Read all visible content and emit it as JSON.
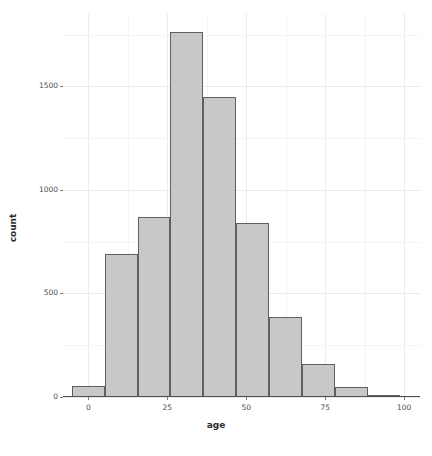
{
  "chart_data": {
    "type": "bar",
    "title": "",
    "subtitle": "",
    "xlabel": "age",
    "ylabel": "count",
    "xlim": [
      -8,
      105
    ],
    "ylim": [
      0,
      1850
    ],
    "grid": true,
    "legend": null,
    "bin_width": 10.4,
    "categories": [
      "-5.2",
      "5.2",
      "15.6",
      "26.0",
      "36.4",
      "46.8",
      "57.2",
      "67.6",
      "78.0",
      "88.4"
    ],
    "bins": [
      {
        "label": "-5.2 to 5.2",
        "x_start": -5.2,
        "x_end": 5.2,
        "value": 55
      },
      {
        "label": "5.2 to 15.6",
        "x_start": 5.2,
        "x_end": 15.6,
        "value": 690
      },
      {
        "label": "15.6 to 26.0",
        "x_start": 15.6,
        "x_end": 26.0,
        "value": 870
      },
      {
        "label": "26.0 to 36.4",
        "x_start": 26.0,
        "x_end": 36.4,
        "value": 1765
      },
      {
        "label": "36.4 to 46.8",
        "x_start": 36.4,
        "x_end": 46.8,
        "value": 1450
      },
      {
        "label": "46.8 to 57.2",
        "x_start": 46.8,
        "x_end": 57.2,
        "value": 840
      },
      {
        "label": "57.2 to 67.6",
        "x_start": 57.2,
        "x_end": 67.6,
        "value": 385
      },
      {
        "label": "67.6 to 78.0",
        "x_start": 67.6,
        "x_end": 78.0,
        "value": 160
      },
      {
        "label": "78.0 to 88.4",
        "x_start": 78.0,
        "x_end": 88.4,
        "value": 50
      },
      {
        "label": "88.4 to 98.8",
        "x_start": 88.4,
        "x_end": 98.8,
        "value": 5
      }
    ],
    "values": [
      55,
      690,
      870,
      1765,
      1450,
      840,
      385,
      160,
      50,
      5
    ],
    "x_ticks": [
      {
        "value": 0,
        "label": "0"
      },
      {
        "value": 25,
        "label": "25"
      },
      {
        "value": 50,
        "label": "50"
      },
      {
        "value": 75,
        "label": "75"
      },
      {
        "value": 100,
        "label": "100"
      }
    ],
    "y_ticks": [
      {
        "value": 0,
        "label": "0"
      },
      {
        "value": 500,
        "label": "500"
      },
      {
        "value": 1000,
        "label": "1000"
      },
      {
        "value": 1500,
        "label": "1500"
      }
    ],
    "colors": {
      "bar_fill": "#c8c8c8",
      "bar_stroke": "#5f5f5f",
      "grid_major": "#ebebeb",
      "grid_minor": "#f4f4f4",
      "panel_background": "#ffffff",
      "axis_text": "#4d4d4d",
      "axis_title": "#2b2b2b"
    }
  }
}
